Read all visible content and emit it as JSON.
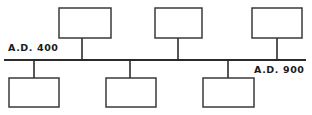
{
  "figure": {
    "type": "timeline",
    "title": "",
    "background_color": "#ffffff",
    "line_color": "#2b2b2b",
    "box_fill": "#ffffff",
    "box_border_color": "#3a3a3a"
  },
  "axis": {
    "orientation": "horizontal",
    "y": 60,
    "x_start": 4,
    "x_end": 306,
    "stroke_width": 2.2,
    "start_label": {
      "text": "A.D. 400",
      "position": "above-left",
      "x": 8,
      "y": 51
    },
    "end_label": {
      "text": "A.D. 900",
      "position": "below-right",
      "x": 254,
      "y": 73
    }
  },
  "entries": [
    {
      "id": "entry-top-1",
      "label": "",
      "side": "above",
      "connector_x": 82,
      "box": {
        "x": 59,
        "y": 8,
        "width": 52,
        "height": 30
      }
    },
    {
      "id": "entry-top-2",
      "label": "",
      "side": "above",
      "connector_x": 178,
      "box": {
        "x": 155,
        "y": 8,
        "width": 47,
        "height": 30
      }
    },
    {
      "id": "entry-top-3",
      "label": "",
      "side": "above",
      "connector_x": 277,
      "box": {
        "x": 252,
        "y": 8,
        "width": 50,
        "height": 30
      }
    },
    {
      "id": "entry-bottom-1",
      "label": "",
      "side": "below",
      "connector_x": 34,
      "box": {
        "x": 9,
        "y": 78,
        "width": 50,
        "height": 29
      }
    },
    {
      "id": "entry-bottom-2",
      "label": "",
      "side": "below",
      "connector_x": 130,
      "box": {
        "x": 106,
        "y": 78,
        "width": 50,
        "height": 29
      }
    },
    {
      "id": "entry-bottom-3",
      "label": "",
      "side": "below",
      "connector_x": 228,
      "box": {
        "x": 203,
        "y": 78,
        "width": 51,
        "height": 29
      }
    }
  ]
}
